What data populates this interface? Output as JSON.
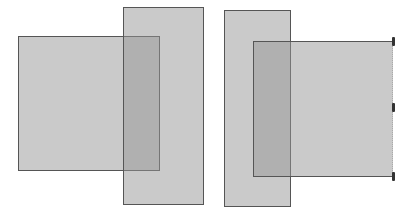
{
  "diagram": {
    "background": "#ffffff",
    "fill_color": "#969696",
    "fill_opacity": 0.5,
    "stroke_color": "#555555",
    "left_group": {
      "wide_rect": {
        "x": 18,
        "y": 36,
        "w": 142,
        "h": 135
      },
      "tall_rect": {
        "x": 123,
        "y": 7,
        "w": 81,
        "h": 198
      }
    },
    "right_group": {
      "tall_rect": {
        "x": 224,
        "y": 10,
        "w": 67,
        "h": 197
      },
      "wide_rect": {
        "x": 253,
        "y": 41,
        "w": 140,
        "h": 136,
        "selected_edge": "right"
      },
      "resize_handles": [
        {
          "x": 392,
          "y": 37
        },
        {
          "x": 392,
          "y": 103
        },
        {
          "x": 392,
          "y": 172
        }
      ]
    }
  }
}
